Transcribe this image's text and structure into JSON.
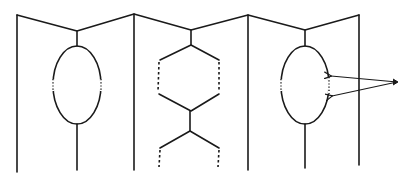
{
  "diagram": {
    "colors": {
      "line": "#1a1a1a",
      "background": "#ffffff"
    },
    "walls": [
      {
        "x": 17,
        "top": 15,
        "bottom": 172
      },
      {
        "x": 134,
        "top": 14,
        "bottom": 170
      },
      {
        "x": 248,
        "top": 15,
        "bottom": 170
      },
      {
        "x": 359,
        "top": 15,
        "bottom": 165
      }
    ],
    "valleys": [
      {
        "x": 77,
        "y": 31
      },
      {
        "x": 191,
        "y": 30
      },
      {
        "x": 305,
        "y": 30
      }
    ],
    "structures": [
      {
        "type": "ellipse",
        "cx": 77,
        "cy": 85,
        "rx": 24,
        "ry": 39,
        "dotted_sides": true
      },
      {
        "type": "hexagon-chain",
        "cx": 191,
        "dashed_sides": true
      },
      {
        "type": "ellipse",
        "cx": 305,
        "cy": 85,
        "rx": 24,
        "ry": 39,
        "dotted_sides": true
      }
    ],
    "arrows": [
      {
        "from": [
          397,
          82
        ],
        "to": [
          330,
          77
        ]
      },
      {
        "from": [
          397,
          82
        ],
        "to": [
          331,
          95
        ]
      }
    ]
  }
}
